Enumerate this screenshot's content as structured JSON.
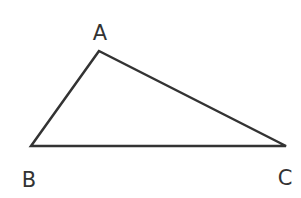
{
  "diagram": {
    "type": "triangle",
    "stroke_color": "#333333",
    "vertices": [
      {
        "label": "A",
        "x": 99,
        "y": 51,
        "label_x": 100,
        "label_y": 40
      },
      {
        "label": "B",
        "x": 31,
        "y": 146,
        "label_x": 29,
        "label_y": 187
      },
      {
        "label": "C",
        "x": 286,
        "y": 146,
        "label_x": 285,
        "label_y": 185
      }
    ]
  }
}
